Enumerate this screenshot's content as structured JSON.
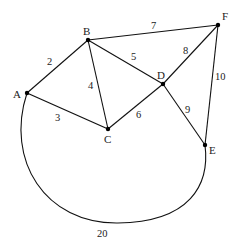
{
  "graph": {
    "type": "weighted-undirected-graph",
    "nodes": [
      {
        "id": "A",
        "x": 27,
        "y": 93,
        "label_x": 13,
        "label_y": 98
      },
      {
        "id": "B",
        "x": 88,
        "y": 40,
        "label_x": 83,
        "label_y": 34
      },
      {
        "id": "C",
        "x": 108,
        "y": 129,
        "label_x": 104,
        "label_y": 143
      },
      {
        "id": "D",
        "x": 163,
        "y": 84,
        "label_x": 158,
        "label_y": 79
      },
      {
        "id": "E",
        "x": 205,
        "y": 145,
        "label_x": 210,
        "label_y": 153
      },
      {
        "id": "F",
        "x": 218,
        "y": 25,
        "label_x": 222,
        "label_y": 19
      }
    ],
    "edges": [
      {
        "from": "A",
        "to": "B",
        "weight": "2",
        "label_x": 48,
        "label_y": 64
      },
      {
        "from": "A",
        "to": "C",
        "weight": "3",
        "label_x": 55,
        "label_y": 120
      },
      {
        "from": "B",
        "to": "C",
        "weight": "4",
        "label_x": 88,
        "label_y": 88
      },
      {
        "from": "B",
        "to": "D",
        "weight": "5",
        "label_x": 131,
        "label_y": 59
      },
      {
        "from": "C",
        "to": "D",
        "weight": "6",
        "label_x": 137,
        "label_y": 118
      },
      {
        "from": "B",
        "to": "F",
        "weight": "7",
        "label_x": 152,
        "label_y": 28
      },
      {
        "from": "D",
        "to": "F",
        "weight": "8",
        "label_x": 183,
        "label_y": 53
      },
      {
        "from": "D",
        "to": "E",
        "weight": "9",
        "label_x": 185,
        "label_y": 112
      },
      {
        "from": "F",
        "to": "E",
        "weight": "10",
        "label_x": 217,
        "label_y": 79
      },
      {
        "from": "A",
        "to": "E",
        "weight": "20",
        "label_x": 97,
        "label_y": 237,
        "curved": true
      }
    ]
  },
  "labels": {
    "A": "A",
    "B": "B",
    "C": "C",
    "D": "D",
    "E": "E",
    "F": "F",
    "w_AB": "2",
    "w_AC": "3",
    "w_BC": "4",
    "w_BD": "5",
    "w_CD": "6",
    "w_BF": "7",
    "w_DF": "8",
    "w_DE": "9",
    "w_FE": "10",
    "w_AE": "20"
  }
}
